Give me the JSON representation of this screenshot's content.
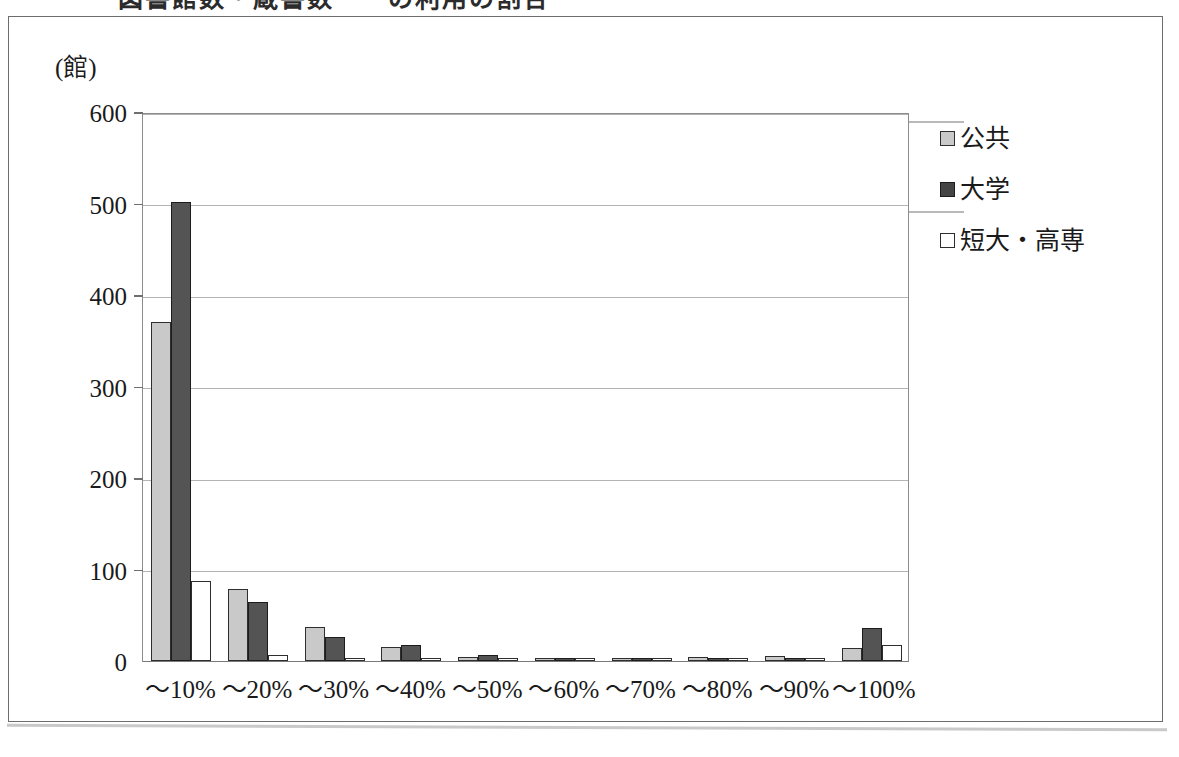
{
  "caption": "図書館数・蔵書数一一の利用の割合",
  "unit_label": "(館)",
  "legend": {
    "items": [
      {
        "label": "公共",
        "swatch": "s0",
        "color": "#c9c9c9"
      },
      {
        "label": "大学",
        "swatch": "s1",
        "color": "#545454"
      },
      {
        "label": "短大・高専",
        "swatch": "s2",
        "color": "#ffffff"
      }
    ]
  },
  "chart_data": {
    "type": "bar",
    "title": "図書館数・蔵書数一一の利用の割合",
    "xlabel": "",
    "ylabel": "(館)",
    "ylim": [
      0,
      600
    ],
    "yticks": [
      0,
      100,
      200,
      300,
      400,
      500,
      600
    ],
    "grid": true,
    "legend_position": "right",
    "categories": [
      "～10%",
      "～20%",
      "～30%",
      "～40%",
      "～50%",
      "～60%",
      "～70%",
      "～80%",
      "～90%",
      "～100%"
    ],
    "series": [
      {
        "name": "公共",
        "color": "#c9c9c9",
        "values": [
          370,
          79,
          37,
          15,
          4,
          2,
          2,
          4,
          5,
          14
        ]
      },
      {
        "name": "大学",
        "color": "#545454",
        "values": [
          502,
          65,
          26,
          17,
          7,
          2,
          3,
          2,
          3,
          36
        ]
      },
      {
        "name": "短大・高専",
        "color": "#ffffff",
        "values": [
          87,
          7,
          3,
          2,
          1,
          1,
          1,
          1,
          1,
          18
        ]
      }
    ]
  }
}
